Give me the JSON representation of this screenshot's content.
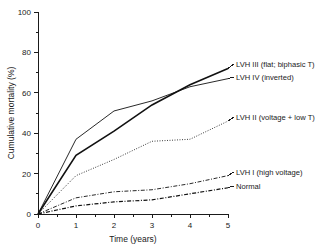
{
  "chart_data": {
    "type": "line",
    "title": "",
    "xlabel": "Time (years)",
    "ylabel": "Cumulative mortality (%)",
    "xlim": [
      0,
      5
    ],
    "ylim": [
      0,
      100
    ],
    "xticks": [
      0,
      1,
      2,
      3,
      4,
      5
    ],
    "xticklabels": [
      "0",
      "1",
      "2",
      "3",
      "4",
      "5"
    ],
    "yticks": [
      0,
      20,
      40,
      60,
      80,
      100
    ],
    "yticklabels": [
      "0",
      "20",
      "40",
      "60",
      "80",
      "100"
    ],
    "minor_ticks": true,
    "grid": false,
    "legend_position": "inline-right-of-curve-ends",
    "x": [
      0,
      1,
      2,
      3,
      4,
      5
    ],
    "series": [
      {
        "name": "LVH III (flat; biphasic T)",
        "label": "LVH III (flat; biphasic T)",
        "style": "solid-thick",
        "color": "#111111",
        "values": [
          0,
          29,
          41,
          54,
          64,
          72
        ]
      },
      {
        "name": "LVH IV (inverted)",
        "label": "LVH IV (inverted)",
        "style": "solid-thin",
        "color": "#111111",
        "values": [
          0,
          37,
          51,
          56,
          63,
          67
        ]
      },
      {
        "name": "LVH II (voltage + low T)",
        "label": "LVH II (voltage + low T)",
        "style": "dotted",
        "color": "#111111",
        "values": [
          0,
          19,
          27,
          36,
          37,
          46
        ]
      },
      {
        "name": "LVH I (high voltage)",
        "label": "LVH I (high voltage)",
        "style": "dash-dot",
        "color": "#111111",
        "values": [
          0,
          8,
          11,
          12,
          15,
          19
        ]
      },
      {
        "name": "Normal",
        "label": "Normal",
        "style": "dash-dot-thick",
        "color": "#111111",
        "values": [
          0,
          4,
          6,
          7,
          10,
          13
        ]
      }
    ],
    "annotations": []
  },
  "labels": {
    "lvh3": "LVH III (flat; biphasic T)",
    "lvh4": "LVH IV (inverted)",
    "lvh2": "LVH II (voltage + low T)",
    "lvh1": "LVH I (high voltage)",
    "normal": "Normal"
  },
  "axes": {
    "x_title": "Time (years)",
    "y_title": "Cumulative mortality (%)",
    "x_0": "0",
    "x_1": "1",
    "x_2": "2",
    "x_3": "3",
    "x_4": "4",
    "x_5": "5",
    "y_0": "0",
    "y_20": "20",
    "y_40": "40",
    "y_60": "60",
    "y_80": "80",
    "y_100": "100"
  }
}
